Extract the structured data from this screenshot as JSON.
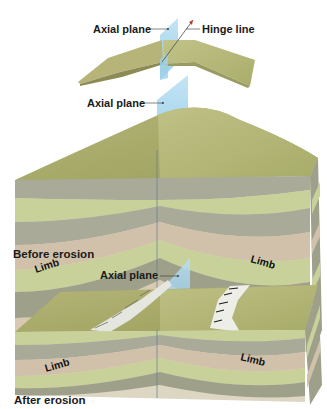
{
  "figure": {
    "top_fold": {
      "axial_plane_label": "Axial plane",
      "hinge_line_label": "Hinge line"
    },
    "before_erosion": {
      "axial_plane_label": "Axial plane",
      "limb_left_label": "Limb",
      "limb_right_label": "Limb",
      "caption": "Before erosion"
    },
    "after_erosion": {
      "axial_plane_label": "Axial plane",
      "limb_left_label": "Limb",
      "limb_right_label": "Limb",
      "caption": "After erosion"
    }
  },
  "colors": {
    "surface": "#a9ad6a",
    "surface_light": "#c4c58c",
    "layer_gray": "#a9aa98",
    "layer_green": "#c9d19a",
    "layer_pink": "#d2c1aa",
    "layer_dark": "#9ea08a",
    "core": "#dcd6c3",
    "plane": "#8ecbe8"
  }
}
